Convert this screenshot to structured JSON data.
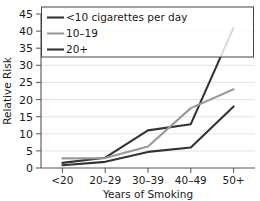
{
  "chart_data": {
    "type": "line",
    "title": "",
    "xlabel": "Years of Smoking",
    "ylabel": "Relative Risk",
    "categories": [
      "<20",
      "20–29",
      "30–39",
      "40–49",
      "50+"
    ],
    "ylim": [
      0,
      45
    ],
    "yticks": [
      0,
      5,
      10,
      15,
      20,
      25,
      30,
      35,
      40,
      45
    ],
    "grid": true,
    "legend_position": "top-left",
    "series": [
      {
        "name": "<10 cigarettes per day",
        "color": "#333333",
        "values": [
          1.5,
          3.0,
          11.0,
          12.8,
          41.0
        ]
      },
      {
        "name": "10–19",
        "color": "#999999",
        "values": [
          2.8,
          2.9,
          6.3,
          17.5,
          23.0
        ]
      },
      {
        "name": "20+",
        "color": "#333333",
        "values": [
          0.8,
          1.8,
          4.7,
          6.0,
          18.0
        ]
      }
    ]
  },
  "axis": {
    "y_tick_labels": [
      "45",
      "40",
      "35",
      "30",
      "25",
      "20",
      "15",
      "10",
      "5",
      "0"
    ],
    "y_title": "Relative Risk",
    "x_tick_labels": [
      "<20",
      "20–29",
      "30–39",
      "40–49",
      "50+"
    ],
    "x_title": "Years of Smoking"
  },
  "legend": {
    "items": [
      {
        "label": "<10 cigarettes per day",
        "swatch": "line-swatch-dark"
      },
      {
        "label": "10–19",
        "swatch": "line-swatch-gray"
      },
      {
        "label": "20+",
        "swatch": "line-swatch-dark"
      }
    ]
  },
  "colors": {
    "series_dark": "#333333",
    "series_gray": "#999999",
    "axis": "#555555",
    "grid": "#d9d9d9",
    "legend_border": "#444444"
  }
}
